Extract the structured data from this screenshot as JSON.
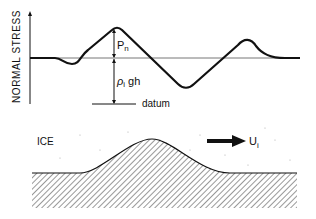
{
  "stress_plot": {
    "y_axis_label": "NORMAL STRESS",
    "pn_label": "P",
    "pn_sub": "n",
    "rho_label": "ρ",
    "rho_sub": "i",
    "rho_suffix": "gh",
    "datum_label": "datum"
  },
  "bed_profile": {
    "ice_label": "ICE",
    "velocity_label": "U",
    "velocity_sub": "i"
  },
  "colors": {
    "ink": "#111111",
    "baseline": "#777777",
    "hatch": "#333333"
  }
}
